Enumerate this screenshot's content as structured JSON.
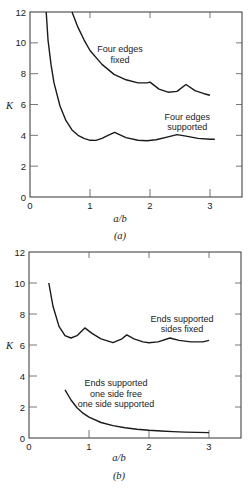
{
  "chart_data": [
    {
      "id": "a",
      "type": "line",
      "caption": "(a)",
      "title": "",
      "xlabel": "a/b",
      "ylabel": "K",
      "xlim": [
        0,
        3.53
      ],
      "ylim": [
        0,
        12
      ],
      "xticks": [
        0,
        1,
        2,
        3
      ],
      "yticks": [
        0,
        2,
        4,
        6,
        8,
        10,
        12
      ],
      "grid": false,
      "series": [
        {
          "name": "Four edges fixed",
          "x": [
            0.7,
            0.8,
            0.9,
            1.0,
            1.2,
            1.4,
            1.6,
            1.8,
            1.95,
            2.0,
            2.15,
            2.3,
            2.45,
            2.6,
            2.75,
            2.9,
            3.0
          ],
          "y": [
            12.0,
            11.0,
            10.2,
            9.5,
            8.6,
            7.95,
            7.6,
            7.4,
            7.4,
            7.45,
            7.0,
            6.8,
            6.85,
            7.3,
            6.9,
            6.7,
            6.6
          ]
        },
        {
          "name": "Four edges supported",
          "x": [
            0.27,
            0.3,
            0.35,
            0.4,
            0.5,
            0.6,
            0.7,
            0.8,
            0.9,
            1.0,
            1.1,
            1.2,
            1.3,
            1.41,
            1.6,
            1.8,
            1.95,
            2.1,
            2.3,
            2.45,
            2.6,
            2.8,
            3.0,
            3.08
          ],
          "y": [
            12.0,
            10.2,
            8.6,
            7.4,
            5.9,
            4.95,
            4.35,
            4.0,
            3.8,
            3.68,
            3.67,
            3.8,
            4.0,
            4.2,
            3.85,
            3.68,
            3.65,
            3.72,
            3.9,
            4.05,
            3.95,
            3.8,
            3.75,
            3.75
          ]
        }
      ],
      "annotations": [
        {
          "text": "Four edges fixed",
          "lines": [
            "Four edges",
            "fixed"
          ],
          "x": 1.5,
          "y": 9.4
        },
        {
          "text": "Four edges supported",
          "lines": [
            "Four edges",
            "supported"
          ],
          "x": 2.62,
          "y": 5.0
        }
      ]
    },
    {
      "id": "b",
      "type": "line",
      "caption": "(b)",
      "title": "",
      "xlabel": "a/b",
      "ylabel": "K",
      "xlim": [
        0,
        3.53
      ],
      "ylim": [
        0,
        12
      ],
      "xticks": [
        0,
        1,
        2,
        3
      ],
      "yticks": [
        0,
        2,
        4,
        6,
        8,
        10,
        12
      ],
      "grid": false,
      "series": [
        {
          "name": "Ends supported sides fixed",
          "x": [
            0.33,
            0.4,
            0.5,
            0.6,
            0.7,
            0.8,
            0.93,
            1.05,
            1.2,
            1.4,
            1.55,
            1.63,
            1.75,
            1.9,
            2.0,
            2.15,
            2.35,
            2.5,
            2.7,
            2.9,
            3.0
          ],
          "y": [
            10.0,
            8.5,
            7.2,
            6.6,
            6.45,
            6.6,
            7.1,
            6.75,
            6.4,
            6.15,
            6.4,
            6.65,
            6.4,
            6.2,
            6.15,
            6.2,
            6.45,
            6.3,
            6.2,
            6.2,
            6.3
          ]
        },
        {
          "name": "Ends supported one side free one side supported",
          "x": [
            0.6,
            0.7,
            0.8,
            0.9,
            1.0,
            1.2,
            1.4,
            1.6,
            1.8,
            2.0,
            2.2,
            2.4,
            2.6,
            2.8,
            3.0
          ],
          "y": [
            3.1,
            2.45,
            1.95,
            1.6,
            1.35,
            1.0,
            0.8,
            0.66,
            0.57,
            0.5,
            0.45,
            0.41,
            0.38,
            0.36,
            0.35
          ]
        }
      ],
      "annotations": [
        {
          "text": "Ends supported sides fixed",
          "lines": [
            "Ends supported",
            "sides fixed"
          ],
          "x": 2.55,
          "y": 7.5
        },
        {
          "text": "Ends supported one side free one side supported",
          "lines": [
            "Ends supported",
            "one side free",
            "one side supported"
          ],
          "x": 1.45,
          "y": 3.35
        }
      ]
    }
  ]
}
